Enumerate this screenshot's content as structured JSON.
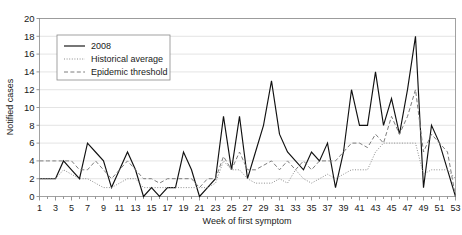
{
  "chart_data": {
    "type": "line",
    "title": "",
    "xlabel": "Week of first symptom",
    "ylabel": "Notified cases",
    "xlim": [
      1,
      53
    ],
    "ylim": [
      0,
      20
    ],
    "ytick_step": 2,
    "yticks": [
      0,
      2,
      4,
      6,
      8,
      10,
      12,
      14,
      16,
      18,
      20
    ],
    "xticks": [
      1,
      3,
      5,
      7,
      9,
      11,
      13,
      15,
      17,
      19,
      21,
      23,
      25,
      27,
      29,
      31,
      33,
      35,
      37,
      39,
      41,
      43,
      45,
      47,
      49,
      51,
      53
    ],
    "xticks_all": [
      1,
      2,
      3,
      4,
      5,
      6,
      7,
      8,
      9,
      10,
      11,
      12,
      13,
      14,
      15,
      16,
      17,
      18,
      19,
      20,
      21,
      22,
      23,
      24,
      25,
      26,
      27,
      28,
      29,
      30,
      31,
      32,
      33,
      34,
      35,
      36,
      37,
      38,
      39,
      40,
      41,
      42,
      43,
      44,
      45,
      46,
      47,
      48,
      49,
      50,
      51,
      52,
      53
    ],
    "grid": "horizontal",
    "legend_position": "top-left-inside",
    "x": [
      1,
      2,
      3,
      4,
      5,
      6,
      7,
      8,
      9,
      10,
      11,
      12,
      13,
      14,
      15,
      16,
      17,
      18,
      19,
      20,
      21,
      22,
      23,
      24,
      25,
      26,
      27,
      28,
      29,
      30,
      31,
      32,
      33,
      34,
      35,
      36,
      37,
      38,
      39,
      40,
      41,
      42,
      43,
      44,
      45,
      46,
      47,
      48,
      49,
      50,
      51,
      52,
      53
    ],
    "series": [
      {
        "name": "2008",
        "style": "solid",
        "color": "#111111",
        "values": [
          2,
          2,
          2,
          4,
          3,
          2,
          6,
          5,
          4,
          1,
          3,
          5,
          3,
          0,
          1,
          0,
          1,
          1,
          5,
          3,
          0,
          1,
          2,
          9,
          3,
          9,
          2,
          5,
          8,
          13,
          7,
          5,
          4,
          3,
          5,
          4,
          6,
          1,
          5,
          12,
          8,
          8,
          14,
          8,
          11,
          7,
          12,
          18,
          1,
          8,
          6,
          3,
          0
        ]
      },
      {
        "name": "Historical average",
        "style": "dotted",
        "color": "#8d8d8d",
        "values": [
          2,
          2,
          2,
          3,
          2.5,
          2,
          2,
          1.5,
          1,
          1,
          1.5,
          2,
          2,
          1,
          1,
          1,
          1,
          1,
          1,
          1,
          1,
          1,
          1.5,
          4,
          3,
          3,
          2,
          1.5,
          1.5,
          1.5,
          2,
          1.5,
          3,
          2,
          1.5,
          2,
          2.5,
          2,
          2.5,
          3,
          3,
          3,
          5,
          6,
          6,
          6,
          6,
          6,
          2.5,
          3,
          3,
          3,
          2
        ]
      },
      {
        "name": "Epidemic threshold",
        "style": "dashed",
        "color": "#7d7d7d",
        "values": [
          4,
          4,
          4,
          4,
          4,
          3,
          3,
          4,
          3,
          2,
          3,
          4,
          3,
          2,
          2,
          1.5,
          2,
          2,
          2,
          2,
          1,
          2,
          2,
          4.5,
          3,
          5,
          3,
          3,
          3.5,
          4,
          3,
          4,
          3,
          4,
          3,
          4,
          4,
          4,
          5,
          6,
          6,
          5.5,
          7,
          6,
          9,
          7,
          9,
          12,
          5,
          7,
          6,
          5,
          0
        ]
      }
    ]
  },
  "legend": {
    "items": [
      {
        "label": "2008",
        "style": "solid"
      },
      {
        "label": "Historical average",
        "style": "dotted"
      },
      {
        "label": "Epidemic threshold",
        "style": "dashed"
      }
    ]
  }
}
